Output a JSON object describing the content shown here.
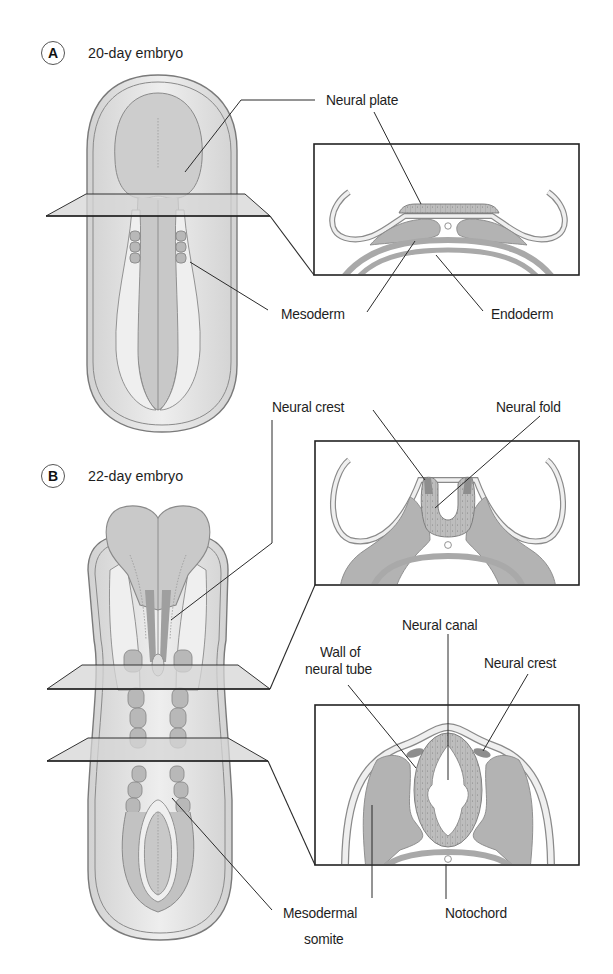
{
  "panels": {
    "a": {
      "badge": "A",
      "title": "20-day embryo",
      "labels": {
        "neural_plate": "Neural plate",
        "mesoderm": "Mesoderm",
        "endoderm": "Endoderm"
      }
    },
    "b": {
      "badge": "B",
      "title": "22-day embryo",
      "labels": {
        "neural_crest_top": "Neural crest",
        "neural_fold": "Neural fold",
        "neural_canal": "Neural canal",
        "wall_of_neural_tube_line1": "Wall of",
        "wall_of_neural_tube_line2": "neural tube",
        "neural_crest_bottom": "Neural crest",
        "mesodermal_somite_line1": "Mesodermal",
        "mesodermal_somite_line2": "somite",
        "notochord": "Notochord"
      }
    }
  },
  "colors": {
    "outline": "#7a7a7a",
    "fill_light": "#e4e4e4",
    "fill_mid": "#c9c9c9",
    "fill_dark": "#a9a9a9",
    "leader": "#2a2a2a",
    "box": "#222222"
  }
}
